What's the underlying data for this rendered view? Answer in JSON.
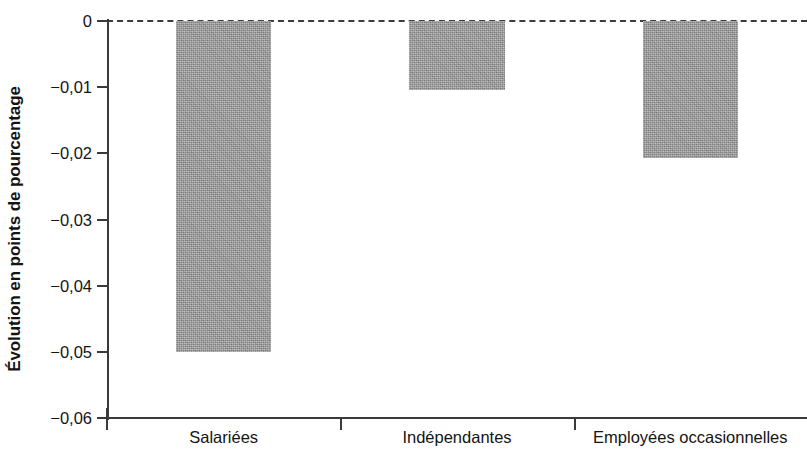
{
  "chart_data": {
    "type": "bar",
    "title": "",
    "subtitle": "",
    "xlabel": "",
    "ylabel": "Évolution en points de pourcentage",
    "categories": [
      "Salariées",
      "Indépendantes",
      "Employées occasionnelles"
    ],
    "values": [
      -0.05,
      -0.0104,
      -0.0207
    ],
    "ylim": [
      -0.06,
      0
    ],
    "ytick_values": [
      0,
      -0.01,
      -0.02,
      -0.03,
      -0.04,
      -0.05,
      -0.06
    ],
    "ytick_labels": [
      "0",
      "−0,01",
      "−0,02",
      "−0,03",
      "−0,04",
      "−0,05",
      "−0,06"
    ],
    "grid": false,
    "legend": null,
    "legend_position": "none",
    "annotations": [],
    "zero_reference_line": {
      "value": 0,
      "style": "dashed",
      "color": "#3c3c3c"
    },
    "series": [
      {
        "name": "",
        "color": "#9c9c9c",
        "values": [
          -0.05,
          -0.0104,
          -0.0207
        ]
      }
    ]
  },
  "colors": {
    "bar_fill": "#9c9c9c",
    "axis": "#3a3a3a",
    "text": "#141414",
    "background": "#ffffff"
  }
}
